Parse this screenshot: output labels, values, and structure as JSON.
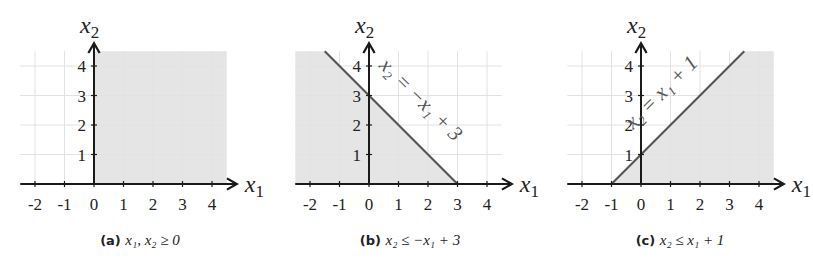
{
  "chart_data": [
    {
      "type": "area",
      "id": "a",
      "caption_tag": "(a)",
      "caption_math": "x₁, x₂ ≥ 0",
      "xlabel": "x1",
      "ylabel": "x2",
      "x_ticks": [
        -2,
        -1,
        0,
        1,
        2,
        3,
        4
      ],
      "y_ticks": [
        1,
        2,
        3,
        4
      ],
      "xlim": [
        -2.5,
        4.5
      ],
      "ylim": [
        0,
        4.5
      ],
      "grid": true,
      "boundary": null,
      "boundary_label": "",
      "shaded_region": [
        [
          0,
          0
        ],
        [
          4.5,
          0
        ],
        [
          4.5,
          4.5
        ],
        [
          0,
          4.5
        ]
      ]
    },
    {
      "type": "area",
      "id": "b",
      "caption_tag": "(b)",
      "caption_math": "x₂ ≤ −x₁ + 3",
      "xlabel": "x1",
      "ylabel": "x2",
      "x_ticks": [
        -2,
        -1,
        0,
        1,
        2,
        3,
        4
      ],
      "y_ticks": [
        1,
        2,
        3,
        4
      ],
      "xlim": [
        -2.5,
        4.5
      ],
      "ylim": [
        0,
        4.5
      ],
      "grid": true,
      "boundary": {
        "slope": -1,
        "intercept": 3,
        "from": [
          -1.5,
          4.5
        ],
        "to": [
          3,
          0
        ]
      },
      "boundary_label": "x₂ = −x₁ + 3",
      "shaded_region": [
        [
          -2.5,
          0
        ],
        [
          3,
          0
        ],
        [
          -1.5,
          4.5
        ],
        [
          -2.5,
          4.5
        ]
      ]
    },
    {
      "type": "area",
      "id": "c",
      "caption_tag": "(c)",
      "caption_math": "x₂ ≤ x₁ + 1",
      "xlabel": "x1",
      "ylabel": "x2",
      "x_ticks": [
        -2,
        -1,
        0,
        1,
        2,
        3,
        4
      ],
      "y_ticks": [
        1,
        2,
        3,
        4
      ],
      "xlim": [
        -2.5,
        4.5
      ],
      "ylim": [
        0,
        4.5
      ],
      "grid": true,
      "boundary": {
        "slope": 1,
        "intercept": 1,
        "from": [
          -1,
          0
        ],
        "to": [
          3.5,
          4.5
        ]
      },
      "boundary_label": "x₂ = x₁ + 1",
      "shaded_region": [
        [
          -1,
          0
        ],
        [
          4.5,
          0
        ],
        [
          4.5,
          4.5
        ],
        [
          3.5,
          4.5
        ]
      ]
    }
  ],
  "panels": [
    {
      "origin": [
        94,
        184
      ],
      "unit": 29.5,
      "caption_x": 140
    },
    {
      "origin": [
        369,
        184
      ],
      "unit": 29.5,
      "caption_x": 410
    },
    {
      "origin": [
        641,
        184
      ],
      "unit": 29.5,
      "caption_x": 680
    }
  ],
  "colors": {
    "region": "#dcdcdc",
    "grid": "#e2e2e2",
    "axis": "#1a1a1a",
    "boundary": "#555555"
  }
}
